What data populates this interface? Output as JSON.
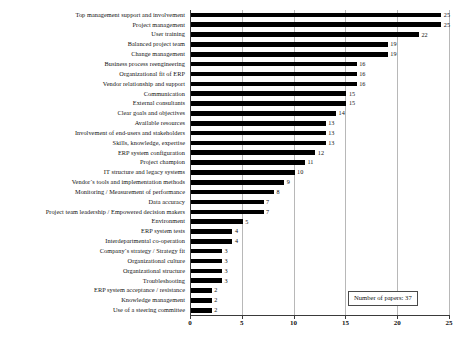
{
  "chart_data": {
    "type": "bar",
    "orientation": "horizontal",
    "title": "",
    "xlabel": "",
    "ylabel": "",
    "xlim": [
      0,
      25
    ],
    "xticks": [
      0,
      5,
      10,
      15,
      20,
      25
    ],
    "grid": true,
    "grid_axis": "x",
    "legend_position": "bottom-right",
    "annotations": [
      "Number of papers: 37"
    ],
    "bar_color": "#000000",
    "categories": [
      "Top management support and involvement",
      "Project management",
      "User training",
      "Balanced project team",
      "Change management",
      "Business process reengineering",
      "Organizational fit of ERP",
      "Vendor relationship and support",
      "Communication",
      "External consultants",
      "Clear goals and objectives",
      "Available resources",
      "Involvement of end-users and stakeholders",
      "Skills, knowledge, expertise",
      "ERP system configuration",
      "Project champion",
      "IT structure and legacy systems",
      "Vendor´s tools and implementation methods",
      "Monitoring / Measurement of performance",
      "Data accuracy",
      "Project team leadership / Empowered decision makers",
      "Environment",
      "ERP system tests",
      "Interdepartmental co-operation",
      "Company´s strategy / Strategy fit",
      "Organizational culture",
      "Organizational structure",
      "Troubleshooting",
      "ERP system acceptance / resistance",
      "Knowledge management",
      "Use of a steering committee"
    ],
    "values": [
      25,
      25,
      22,
      19,
      19,
      16,
      16,
      16,
      15,
      15,
      14,
      13,
      13,
      13,
      12,
      11,
      10,
      9,
      8,
      7,
      7,
      5,
      4,
      4,
      3,
      3,
      3,
      3,
      2,
      2,
      2
    ]
  },
  "legend": {
    "text": "Number of papers: 37"
  },
  "axis": {
    "tick_labels": [
      "0",
      "5",
      "10",
      "15",
      "20",
      "25"
    ]
  }
}
